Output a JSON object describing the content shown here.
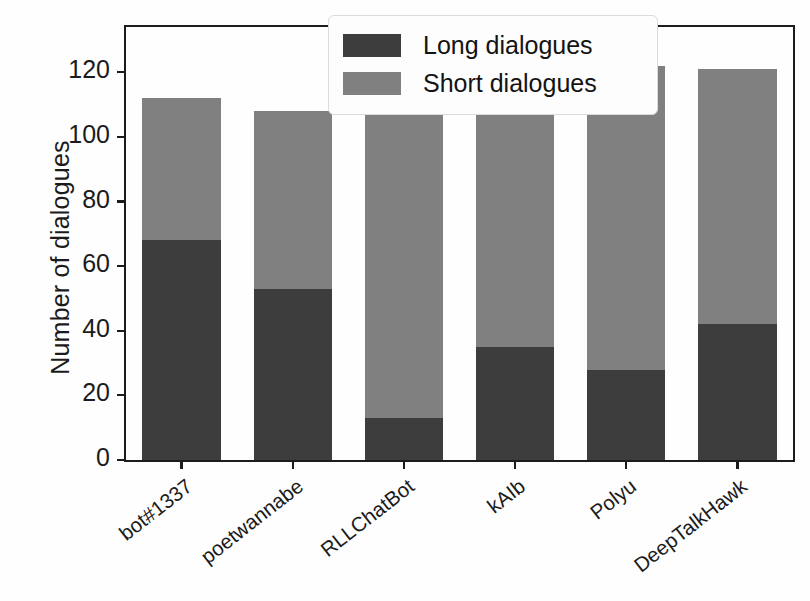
{
  "chart_data": {
    "type": "bar",
    "subtype": "stacked-bar",
    "title": "",
    "xlabel": "",
    "ylabel": "Number of dialogues",
    "categories": [
      "bot#1337",
      "poetwannabe",
      "RLLChatBot",
      "kAIb",
      "Polyu",
      "DeepTalkHawk"
    ],
    "series": [
      {
        "name": "Long dialogues",
        "color": "#3d3d3d",
        "values": [
          68,
          53,
          13,
          35,
          28,
          42
        ]
      },
      {
        "name": "Short dialogues",
        "color": "#808080",
        "values": [
          44,
          55,
          113,
          87,
          94,
          79
        ]
      }
    ],
    "totals": [
      112,
      108,
      126,
      122,
      122,
      121
    ],
    "ylim": [
      0,
      134
    ],
    "yticks": [
      0,
      20,
      40,
      60,
      80,
      100,
      120
    ],
    "ytick_labels": [
      "0",
      "20",
      "40",
      "60",
      "80",
      "100",
      "120"
    ],
    "grid": false,
    "legend_position": "top-right",
    "stack_order": [
      "Long dialogues",
      "Short dialogues"
    ]
  },
  "legend": {
    "entries": [
      {
        "label": "Long dialogues",
        "color": "#3d3d3d"
      },
      {
        "label": "Short dialogues",
        "color": "#808080"
      }
    ]
  },
  "axes": {
    "y_title": "Number of dialogues"
  }
}
